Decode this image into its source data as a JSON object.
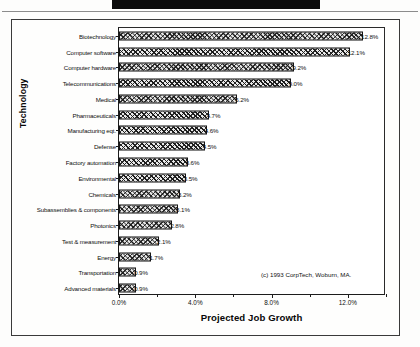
{
  "figure": {
    "credit": "(c) 1993 CorpTech, Woburn, MA."
  },
  "chart_data": {
    "type": "bar",
    "orientation": "horizontal",
    "title": "",
    "xlabel": "Projected Job Growth",
    "ylabel": "Technology",
    "xlim": [
      0,
      14
    ],
    "xticks": [
      "0.0%",
      "4.0%",
      "8.0%",
      "12.0%"
    ],
    "xtick_values": [
      0,
      4,
      8,
      12
    ],
    "grid": false,
    "legend": null,
    "categories": [
      "Biotechnology",
      "Computer software",
      "Computer hardware",
      "Telecommunications",
      "Medical",
      "Pharmaceuticals",
      "Manufacturing eqt.",
      "Defense",
      "Factory automation",
      "Environmental",
      "Chemicals",
      "Subassemblies & components",
      "Photonics",
      "Test & measurement",
      "Energy",
      "Transportation",
      "Advanced materials"
    ],
    "values": [
      12.8,
      12.1,
      9.2,
      9.0,
      6.2,
      4.7,
      4.6,
      4.5,
      3.6,
      3.5,
      3.2,
      3.1,
      2.8,
      2.1,
      1.7,
      0.9,
      0.9
    ],
    "value_labels": [
      "12.8%",
      "12.1%",
      "9.2%",
      "9.0%",
      "6.2%",
      "4.7%",
      "4.6%",
      "4.5%",
      "3.6%",
      "3.5%",
      "3.2%",
      "3.1%",
      "2.8%",
      "2.1%",
      "1.7%",
      "0.9%",
      "0.9%"
    ]
  }
}
